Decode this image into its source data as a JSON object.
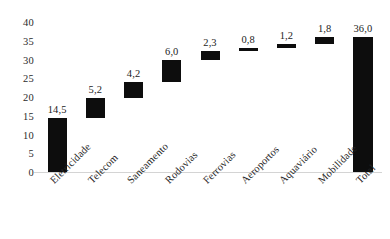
{
  "chart_data": {
    "type": "bar",
    "chart_style": "waterfall",
    "title": "",
    "subtitle": "",
    "xlabel": "",
    "ylabel": "",
    "ylim": [
      0,
      40
    ],
    "yticks": [
      0,
      5,
      10,
      15,
      20,
      25,
      30,
      35,
      40
    ],
    "ytick_labels": [
      "0",
      "5",
      "10",
      "15",
      "20",
      "25",
      "30",
      "35",
      "40"
    ],
    "grid": false,
    "legend": null,
    "decimal_separator": ",",
    "bar_color": "#0d0d0d",
    "categories": [
      "Eletricidade",
      "Telecom",
      "Saneamento",
      "Rodovias",
      "Ferrovias",
      "Aeroportos",
      "Aquaviário",
      "Mobilidade",
      "Total"
    ],
    "values": [
      14.5,
      5.2,
      4.2,
      6.0,
      2.3,
      0.8,
      1.2,
      1.8,
      36.0
    ],
    "data_labels": [
      "14,5",
      "5,2",
      "4,2",
      "6,0",
      "2,3",
      "0,8",
      "1,2",
      "1,8",
      "36,0"
    ],
    "bar_bases": [
      0,
      14.5,
      19.7,
      23.9,
      29.9,
      32.2,
      33.0,
      34.2,
      0
    ],
    "bar_tops": [
      14.5,
      19.7,
      23.9,
      29.9,
      32.2,
      33.0,
      34.2,
      36.0,
      36.0
    ],
    "is_total": [
      false,
      false,
      false,
      false,
      false,
      false,
      false,
      false,
      true
    ],
    "bars": [
      {
        "category": "Eletricidade",
        "value": 14.5,
        "label": "14,5",
        "base": 0,
        "top": 14.5
      },
      {
        "category": "Telecom",
        "value": 5.2,
        "label": "5,2",
        "base": 14.5,
        "top": 19.7
      },
      {
        "category": "Saneamento",
        "value": 4.2,
        "label": "4,2",
        "base": 19.7,
        "top": 23.9
      },
      {
        "category": "Rodovias",
        "value": 6.0,
        "label": "6,0",
        "base": 23.9,
        "top": 29.9
      },
      {
        "category": "Ferrovias",
        "value": 2.3,
        "label": "2,3",
        "base": 29.9,
        "top": 32.2
      },
      {
        "category": "Aeroportos",
        "value": 0.8,
        "label": "0,8",
        "base": 32.2,
        "top": 33.0
      },
      {
        "category": "Aquaviário",
        "value": 1.2,
        "label": "1,2",
        "base": 33.0,
        "top": 34.2
      },
      {
        "category": "Mobilidade",
        "value": 1.8,
        "label": "1,8",
        "base": 34.2,
        "top": 36.0
      },
      {
        "category": "Total",
        "value": 36.0,
        "label": "36,0",
        "base": 0,
        "top": 36.0
      }
    ]
  }
}
